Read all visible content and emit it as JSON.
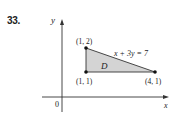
{
  "problem_number": "33.",
  "axes": {
    "x_label": "x",
    "y_label": "y",
    "origin_label": "0"
  },
  "region": {
    "label": "D",
    "fill": "#d4d4d4"
  },
  "line_equation": "x + 3y = 7",
  "vertices": [
    {
      "label": "(1, 2)",
      "x": 1,
      "y": 2
    },
    {
      "label": "(1, 1)",
      "x": 1,
      "y": 1
    },
    {
      "label": "(4, 1)",
      "x": 4,
      "y": 1
    }
  ]
}
